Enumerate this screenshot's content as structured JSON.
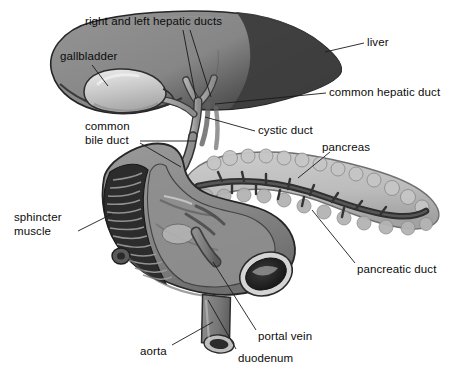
{
  "figure": {
    "style": "grayscale medical illustration",
    "width": 456,
    "height": 376,
    "background_color": "#ffffff",
    "text_color": "#0b0b0b"
  },
  "palette": {
    "background": "#ffffff",
    "liver_left_lobe": "#8d8d8d",
    "liver_right_lobe": "#3f3f3f",
    "liver_outline": "#2b2b2b",
    "gallbladder": "#c9c9c9",
    "gallbladder_highlight": "#e2e2e2",
    "duct": "#9a9a9a",
    "duct_outline": "#3a3a3a",
    "pancreas": "#bdbdbd",
    "pancreas_outline": "#6e6e6e",
    "pancreatic_duct": "#3c3c3c",
    "duodenum": "#8a8a8a",
    "duodenum_dark": "#2f2f2f",
    "duodenum_lumen": "#1d1d1d",
    "vessel": "#7b7b7b",
    "vessel_dark": "#4a4a4a",
    "leader_line": "#1a1a1a"
  },
  "labels": [
    {
      "id": "right-and-left-hepatic-ducts",
      "text": "right and left hepatic ducts",
      "lines": [
        "right and left hepatic ducts"
      ],
      "x": 85,
      "y": 15,
      "align": "left",
      "leaders": [
        {
          "x1": 183,
          "y1": 30,
          "x2": 196,
          "y2": 99
        },
        {
          "x1": 190,
          "y1": 30,
          "x2": 211,
          "y2": 97
        }
      ]
    },
    {
      "id": "gallbladder",
      "text": "gallbladder",
      "lines": [
        "gallbladder"
      ],
      "x": 60,
      "y": 50,
      "align": "left",
      "leaders": [
        {
          "x1": 92,
          "y1": 65,
          "x2": 108,
          "y2": 86
        }
      ]
    },
    {
      "id": "liver",
      "text": "liver",
      "lines": [
        "liver"
      ],
      "x": 367,
      "y": 36,
      "align": "left",
      "leaders": [
        {
          "x1": 364,
          "y1": 43,
          "x2": 325,
          "y2": 52
        }
      ]
    },
    {
      "id": "common-hepatic-duct",
      "text": "common hepatic duct",
      "lines": [
        "common hepatic duct"
      ],
      "x": 329,
      "y": 86,
      "align": "left",
      "leaders": [
        {
          "x1": 326,
          "y1": 93,
          "x2": 215,
          "y2": 104
        }
      ]
    },
    {
      "id": "cystic-duct",
      "text": "cystic duct",
      "lines": [
        "cystic duct"
      ],
      "x": 258,
      "y": 124,
      "align": "left",
      "leaders": [
        {
          "x1": 255,
          "y1": 131,
          "x2": 205,
          "y2": 117
        }
      ]
    },
    {
      "id": "common-bile-duct",
      "text": "common bile duct",
      "lines": [
        "common",
        "bile duct"
      ],
      "x": 85,
      "y": 120,
      "align": "left",
      "leaders": [
        {
          "x1": 140,
          "y1": 141,
          "x2": 196,
          "y2": 141
        },
        {
          "x1": 140,
          "y1": 143,
          "x2": 181,
          "y2": 167
        }
      ]
    },
    {
      "id": "pancreas",
      "text": "pancreas",
      "lines": [
        "pancreas"
      ],
      "x": 322,
      "y": 141,
      "align": "left",
      "leaders": [
        {
          "x1": 330,
          "y1": 152,
          "x2": 298,
          "y2": 178
        }
      ]
    },
    {
      "id": "sphincter-muscle",
      "text": "sphincter muscle",
      "lines": [
        "sphincter",
        "muscle"
      ],
      "x": 14,
      "y": 211,
      "align": "left",
      "leaders": [
        {
          "x1": 78,
          "y1": 231,
          "x2": 112,
          "y2": 214
        }
      ]
    },
    {
      "id": "pancreatic-duct",
      "text": "pancreatic duct",
      "lines": [
        "pancreatic duct"
      ],
      "x": 357,
      "y": 263,
      "align": "left",
      "leaders": [
        {
          "x1": 355,
          "y1": 263,
          "x2": 312,
          "y2": 210
        }
      ]
    },
    {
      "id": "portal-vein",
      "text": "portal vein",
      "lines": [
        "portal vein"
      ],
      "x": 258,
      "y": 330,
      "align": "left",
      "leaders": [
        {
          "x1": 256,
          "y1": 330,
          "x2": 213,
          "y2": 262
        }
      ]
    },
    {
      "id": "aorta",
      "text": "aorta",
      "lines": [
        "aorta"
      ],
      "x": 140,
      "y": 345,
      "align": "left",
      "leaders": [
        {
          "x1": 172,
          "y1": 345,
          "x2": 213,
          "y2": 322
        }
      ]
    },
    {
      "id": "duodenum",
      "text": "duodenum",
      "lines": [
        "duodenum"
      ],
      "x": 238,
      "y": 352,
      "align": "left",
      "leaders": [
        {
          "x1": 236,
          "y1": 349,
          "x2": 208,
          "y2": 300
        }
      ]
    }
  ],
  "structures": [
    {
      "id": "liver",
      "name": "liver",
      "description": "large shaded lobed organ occupying the upper portion"
    },
    {
      "id": "gallbladder",
      "name": "gallbladder",
      "description": "pale pear-shaped sac beneath the liver"
    },
    {
      "id": "hepatic-ducts",
      "name": "right and left hepatic ducts",
      "description": "Y-shaped pair of ducts leaving the liver hilum"
    },
    {
      "id": "common-hepatic-duct",
      "name": "common hepatic duct",
      "description": "duct formed by union of right and left hepatic ducts"
    },
    {
      "id": "cystic-duct",
      "name": "cystic duct",
      "description": "duct from gallbladder neck joining the common hepatic duct"
    },
    {
      "id": "common-bile-duct",
      "name": "common bile duct",
      "description": "duct descending behind the duodenum to the ampulla"
    },
    {
      "id": "pancreas",
      "name": "pancreas",
      "description": "lobulated gland extending to the left across the midline"
    },
    {
      "id": "pancreatic-duct",
      "name": "pancreatic duct",
      "description": "dark branching duct running the length of the pancreas"
    },
    {
      "id": "duodenum",
      "name": "duodenum",
      "description": "C-shaped loop of small intestine shown in cutaway with plicae"
    },
    {
      "id": "sphincter-muscle",
      "name": "sphincter muscle",
      "description": "muscular ring at the duodenal papilla"
    },
    {
      "id": "portal-vein",
      "name": "portal vein",
      "description": "large vessel posterior to the duodenum"
    },
    {
      "id": "aorta",
      "name": "aorta",
      "description": "cut cylindrical vessel at the lower right"
    }
  ]
}
